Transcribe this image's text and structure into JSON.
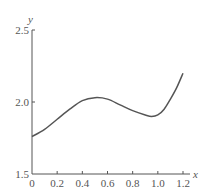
{
  "chart_data": {
    "type": "line",
    "title": "",
    "xlabel": "x",
    "ylabel": "y",
    "xlim": [
      0,
      1.2
    ],
    "ylim": [
      1.5,
      2.5
    ],
    "grid": false,
    "x_ticks": [
      "0",
      "0.2",
      "0.4",
      "0.6",
      "0.8",
      "1.0",
      "1.2"
    ],
    "y_ticks": [
      "1.5",
      "2.0",
      "2.5"
    ],
    "series": [
      {
        "name": "y",
        "x": [
          0,
          0.1,
          0.2,
          0.3,
          0.4,
          0.5,
          0.6,
          0.7,
          0.8,
          0.9,
          0.95,
          1.0,
          1.05,
          1.1,
          1.15,
          1.2
        ],
        "values": [
          1.76,
          1.81,
          1.88,
          1.95,
          2.01,
          2.03,
          2.02,
          1.98,
          1.94,
          1.91,
          1.9,
          1.91,
          1.95,
          2.02,
          2.1,
          2.2
        ]
      }
    ]
  }
}
